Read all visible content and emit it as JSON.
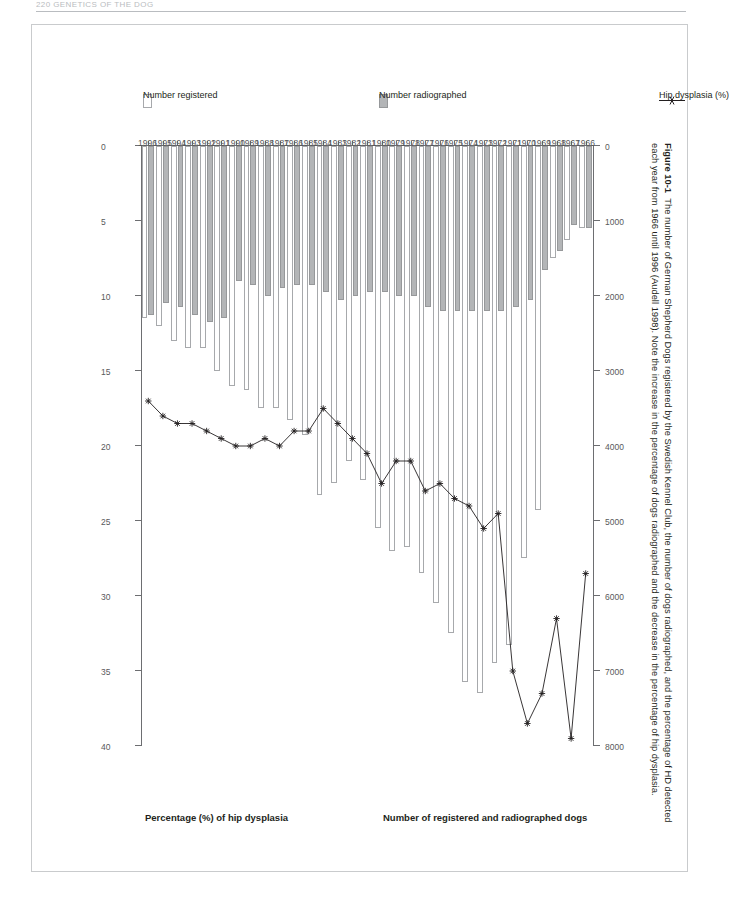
{
  "running_head": "220 GENETICS OF THE DOG",
  "figure": {
    "label": "Figure 10-1",
    "caption": "The number of German Shepherd Dogs registered by the Swedish Kennel Club, the number of dogs radiographed, and the percentage of HD detected each year from 1966 until 1996 (Audell 1998). Note the increase in the percentage of dogs radiographed and the decrease in the percentage of hip dysplasia."
  },
  "legend": {
    "items": [
      {
        "label": "Number registered",
        "swatch": "white-box",
        "color": "#ffffff"
      },
      {
        "label": "Number radiographed",
        "swatch": "gray-box",
        "color": "#b3b5b7"
      },
      {
        "label": "Hip dysplasia (%)",
        "swatch": "line-marker",
        "color": "#231f20"
      }
    ]
  },
  "chart_data": {
    "type": "bar",
    "title": "",
    "orientation": "horizontal",
    "grid": false,
    "legend_position": "right",
    "xlabel": "Number of registered and radiographed dogs",
    "xlabel_secondary": "Percentage (%) of hip dysplasia",
    "ylabel": "",
    "xlim": [
      0,
      8000
    ],
    "xticks": [
      0,
      1000,
      2000,
      3000,
      4000,
      5000,
      6000,
      7000,
      8000
    ],
    "xticklabels": [
      "0",
      "1000",
      "2000",
      "3000",
      "4000",
      "5000",
      "6000",
      "7000",
      "8000"
    ],
    "x2lim": [
      0,
      40
    ],
    "x2ticks": [
      0,
      5,
      10,
      15,
      20,
      25,
      30,
      35,
      40
    ],
    "x2ticklabels": [
      "0",
      "5",
      "10",
      "15",
      "20",
      "25",
      "30",
      "35",
      "40"
    ],
    "categories": [
      "1966",
      "1967",
      "1968",
      "1969",
      "1970",
      "1971",
      "1972",
      "1973",
      "1974",
      "1975",
      "1976",
      "1977",
      "1978",
      "1979",
      "1980",
      "1981",
      "1982",
      "1983",
      "1984",
      "1985",
      "1986",
      "1987",
      "1988",
      "1989",
      "1990",
      "1991",
      "1992",
      "1993",
      "1994",
      "1995",
      "1996"
    ],
    "series": [
      {
        "name": "Number registered",
        "axis": "bottom",
        "values": [
          1100,
          1250,
          1500,
          4850,
          5500,
          6650,
          6900,
          7300,
          7150,
          6500,
          6100,
          5700,
          5350,
          5400,
          5100,
          4450,
          4200,
          4500,
          4650,
          3850,
          3650,
          3500,
          3500,
          3250,
          3200,
          3000,
          2700,
          2700,
          2600,
          2400,
          2300
        ]
      },
      {
        "name": "Number radiographed",
        "axis": "bottom",
        "values": [
          1100,
          1050,
          1400,
          1650,
          2050,
          2150,
          2200,
          2200,
          2200,
          2200,
          2200,
          2150,
          2000,
          2000,
          1950,
          1950,
          2000,
          2050,
          1950,
          1850,
          1850,
          1900,
          2000,
          1850,
          1800,
          2300,
          2350,
          2250,
          2150,
          2100,
          2250
        ]
      },
      {
        "name": "Hip dysplasia (%)",
        "axis": "top",
        "values": [
          28.5,
          39.5,
          31.5,
          36.5,
          38.5,
          35.0,
          24.5,
          25.5,
          24.0,
          23.5,
          22.5,
          23.0,
          21.0,
          21.0,
          22.5,
          20.5,
          19.5,
          18.5,
          17.5,
          19.0,
          19.0,
          20.0,
          19.5,
          20.0,
          20.0,
          19.5,
          19.0,
          18.5,
          18.5,
          18.0,
          17.0
        ]
      }
    ]
  }
}
